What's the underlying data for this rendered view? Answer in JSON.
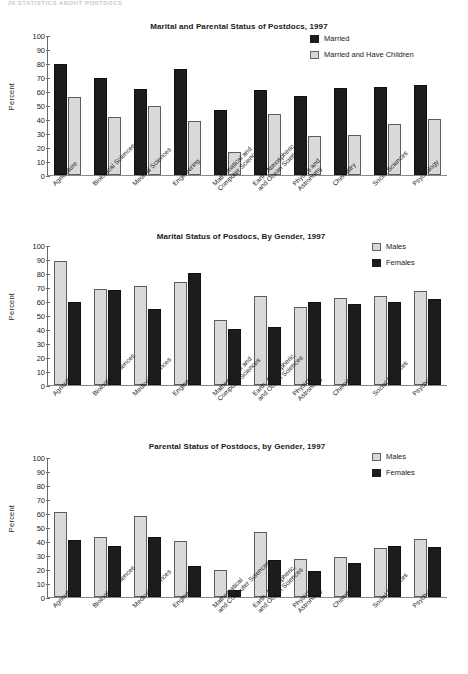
{
  "page_header": "26   STATISTICS ABOUT POSTDOCS",
  "y_axis": {
    "label": "Percent",
    "ticks": [
      0,
      10,
      20,
      30,
      40,
      50,
      60,
      70,
      80,
      90,
      100
    ]
  },
  "charts": [
    {
      "id": "marital-and-parental-status",
      "title": "Marital and Parental Status of Postdocs, 1997",
      "legend": [
        {
          "label": "Married",
          "style": "dark"
        },
        {
          "label": "Married and Have Children",
          "style": "light"
        }
      ]
    },
    {
      "id": "marital-status-by-gender",
      "title": "Marital Status of Posdocs, By Gender, 1997",
      "legend": [
        {
          "label": "Males",
          "style": "light"
        },
        {
          "label": "Females",
          "style": "dark"
        }
      ]
    },
    {
      "id": "parental-status-by-gender",
      "title": "Parental Status of Postdocs, by Gender, 1997",
      "legend": [
        {
          "label": "Males",
          "style": "light"
        },
        {
          "label": "Females",
          "style": "dark"
        }
      ]
    }
  ],
  "chart_data": [
    {
      "type": "bar",
      "title": "Marital and Parental Status of Postdocs, 1997",
      "xlabel": "",
      "ylabel": "Percent",
      "ylim": [
        0,
        100
      ],
      "grid": false,
      "legend_position": "top-right",
      "categories": [
        "Agriculture",
        "Biological Sciences",
        "Medical Sciences",
        "Engineering",
        "Mathematical and Computer Sciences",
        "Earth, Atmospheric, and Ocean Sciences",
        "Physics and Astronomy",
        "Chemistry",
        "Social Sciences",
        "Psychology"
      ],
      "category_lines": [
        [
          "Agriculture"
        ],
        [
          "Biological Sciences"
        ],
        [
          "Medical Sciences"
        ],
        [
          "Engineering"
        ],
        [
          "Mathematical and",
          "Computer Sciences"
        ],
        [
          "Earth, Atmospheric,",
          "and Ocean Sciences"
        ],
        [
          "Physics and",
          "Astronomy"
        ],
        [
          "Chemistry"
        ],
        [
          "Social Sciences"
        ],
        [
          "Psychology"
        ]
      ],
      "series": [
        {
          "name": "Married",
          "style": "dark",
          "values": [
            80,
            69.5,
            62,
            76.5,
            46.5,
            61,
            57,
            62.5,
            63,
            65
          ]
        },
        {
          "name": "Married and Have Children",
          "style": "light",
          "values": [
            56,
            41.5,
            50,
            39,
            16.5,
            44,
            28,
            29,
            37,
            40
          ]
        }
      ]
    },
    {
      "type": "bar",
      "title": "Marital Status of Posdocs, By Gender, 1997",
      "xlabel": "",
      "ylabel": "Percent",
      "ylim": [
        0,
        100
      ],
      "grid": false,
      "legend_position": "top-right",
      "categories": [
        "Agriculture",
        "Biological Sciences",
        "Medical Sciences",
        "Engineering",
        "Mathematical and Computer Sciences",
        "Earth, Atmospheric, and Ocean Sciences",
        "Physics and Astronomy",
        "Chemistry",
        "Social Sciences",
        "Psychology"
      ],
      "category_lines": [
        [
          "Agriculture"
        ],
        [
          "Biological Sciences"
        ],
        [
          "Medical Sciences"
        ],
        [
          "Engineering"
        ],
        [
          "Mathematical and",
          "Computer Sciences"
        ],
        [
          "Earth, Atmospheric,",
          "and Ocean Sciences"
        ],
        [
          "Physics and",
          "Astronomy"
        ],
        [
          "Chemistry"
        ],
        [
          "Social Sciences"
        ],
        [
          "Psychology"
        ]
      ],
      "series": [
        {
          "name": "Males",
          "style": "light",
          "values": [
            89.5,
            69,
            71.5,
            74,
            47,
            64,
            56,
            62.5,
            64,
            67.5
          ]
        },
        {
          "name": "Females",
          "style": "dark",
          "values": [
            60,
            68,
            54.5,
            80.5,
            40.5,
            42,
            59.5,
            58.5,
            60,
            62
          ]
        }
      ]
    },
    {
      "type": "bar",
      "title": "Parental Status of Postdocs, by Gender, 1997",
      "xlabel": "",
      "ylabel": "Percent",
      "ylim": [
        0,
        100
      ],
      "grid": false,
      "legend_position": "top-right",
      "categories": [
        "Agriculture",
        "Biological Sciences",
        "Medical Sciences",
        "Engineering",
        "Mathematical and Computer Sciences",
        "Earth, Atmospheric, and Ocean Sciences",
        "Physics and Astronomy",
        "Chemistry",
        "Social Sciences",
        "Psychology"
      ],
      "category_lines": [
        [
          "Agriculture"
        ],
        [
          "Biological Sciences"
        ],
        [
          "Medical Sciences"
        ],
        [
          "Engineering"
        ],
        [
          "Mathematical",
          "and Computer Sciences"
        ],
        [
          "Earth, Atmospheric,",
          "and Ocean Sciences"
        ],
        [
          "Physics and",
          "Astronomy"
        ],
        [
          "Chemistry"
        ],
        [
          "Social Sciences"
        ],
        [
          "Psychology"
        ]
      ],
      "series": [
        {
          "name": "Males",
          "style": "light",
          "values": [
            61.5,
            43,
            58.5,
            40.5,
            19.5,
            47,
            27.5,
            28.5,
            35,
            41.5
          ]
        },
        {
          "name": "Females",
          "style": "dark",
          "values": [
            41,
            36.5,
            43,
            22,
            5,
            26.5,
            19,
            24.5,
            36.5,
            36
          ]
        }
      ]
    }
  ]
}
